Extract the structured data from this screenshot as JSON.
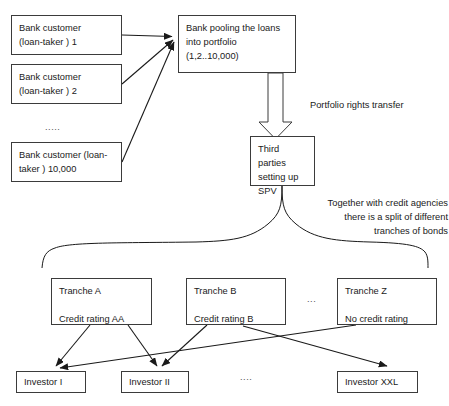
{
  "diagram": {
    "background_color": "#ffffff",
    "stroke_color": "#3b3b3b",
    "text_color": "#1a1a1a"
  },
  "borrowers": {
    "group_label": "Bank customers",
    "items": [
      {
        "id": "customer-1",
        "text": "Bank customer\n(loan-taker ) 1"
      },
      {
        "id": "customer-2",
        "text": "Bank customer\n(loan-taker ) 2"
      },
      {
        "id": "customer-n",
        "text": "Bank customer (loan-\ntaker ) 10,000"
      }
    ],
    "ellipsis": "....."
  },
  "pooling": {
    "text": "Bank pooling the loans\ninto portfolio\n(1,2..10,000)"
  },
  "transfer_label": "Portfolio rights transfer",
  "spv": {
    "text": "Third parties\nsetting up\nSPV"
  },
  "split_label": "Together with credit agencies\nthere is a split of different\ntranches of bonds",
  "tranches": {
    "items": [
      {
        "id": "tranche-a",
        "text": "Tranche A\n\nCredit rating AA",
        "name": "Tranche A",
        "rating": "Credit rating AA"
      },
      {
        "id": "tranche-b",
        "text": "Tranche B\n\nCredit rating B",
        "name": "Tranche B",
        "rating": "Credit rating B"
      },
      {
        "id": "tranche-z",
        "text": "Tranche Z\n\nNo credit rating",
        "name": "Tranche Z",
        "rating": "No credit rating"
      }
    ],
    "ellipsis": "..."
  },
  "investors": {
    "items": [
      {
        "id": "investor-1",
        "text": "Investor I"
      },
      {
        "id": "investor-2",
        "text": "Investor II"
      },
      {
        "id": "investor-xxl",
        "text": "Investor XXL"
      }
    ],
    "ellipsis": "...."
  }
}
